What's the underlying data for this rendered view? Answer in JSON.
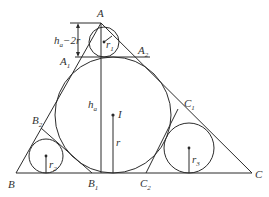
{
  "diagram": {
    "stroke_color": "#2b2b2b",
    "background": "#ffffff",
    "vertices": {
      "A": {
        "label": "A",
        "x": 101,
        "y": 23
      },
      "B": {
        "label": "B",
        "x": 16,
        "y": 173
      },
      "C": {
        "label": "C",
        "x": 252,
        "y": 173
      }
    },
    "points": {
      "A1": {
        "label": "A",
        "sub": "1"
      },
      "A2": {
        "label": "A",
        "sub": "2"
      },
      "B1": {
        "label": "B",
        "sub": "1"
      },
      "B2": {
        "label": "B",
        "sub": "2"
      },
      "C1": {
        "label": "C",
        "sub": "1"
      },
      "C2": {
        "label": "C",
        "sub": "2"
      },
      "I": {
        "label": "I"
      }
    },
    "circles": {
      "incircle": {
        "cx": 113,
        "cy": 115,
        "r": 58,
        "radius_label": "r"
      },
      "circle_A": {
        "cx": 104,
        "cy": 42,
        "r": 15,
        "radius_label": "r",
        "radius_sub": "1"
      },
      "circle_B": {
        "cx": 46,
        "cy": 156,
        "r": 17,
        "radius_label": "r",
        "radius_sub": "2"
      },
      "circle_C": {
        "cx": 189,
        "cy": 148,
        "r": 25,
        "radius_label": "r",
        "radius_sub": "3"
      }
    },
    "labels": {
      "altitude": {
        "text": "h",
        "sub": "a"
      },
      "dimension": {
        "prefix": "h",
        "sub": "a",
        "suffix": "−2r"
      }
    }
  }
}
